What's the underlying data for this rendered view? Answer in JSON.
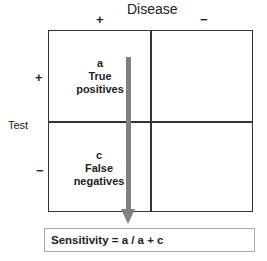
{
  "header": {
    "title": "Disease"
  },
  "columns": [
    {
      "sign": "+"
    },
    {
      "sign": "−"
    }
  ],
  "rows": [
    {
      "sign": "+"
    },
    {
      "sign": "−"
    }
  ],
  "row_axis_label": "Test",
  "cells": {
    "a": {
      "letter": "a",
      "line1": "True",
      "line2": "positives"
    },
    "c": {
      "letter": "c",
      "line1": "False",
      "line2": "negatives"
    }
  },
  "arrow": {
    "color": "#808080",
    "direction": "down"
  },
  "formula": {
    "text": "Sensitivity = a / a + c"
  }
}
